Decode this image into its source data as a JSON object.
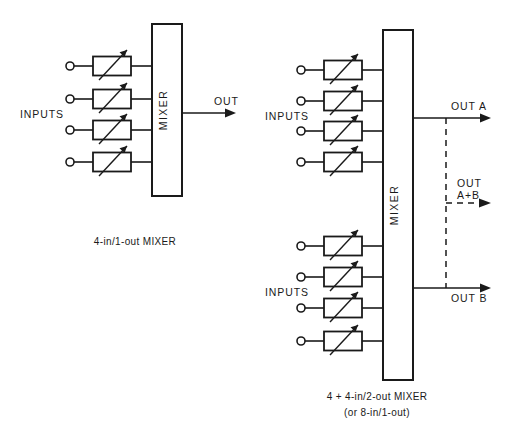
{
  "figure": {
    "background_color": "#ffffff",
    "line_color": "#1a1a1a"
  },
  "diagrams": [
    {
      "id": "left",
      "caption": "4-in/1-out MIXER",
      "inputs_label": "INPUTS",
      "block_label": "MIXER",
      "input_count": 4,
      "outputs": [
        {
          "label": "OUT",
          "style": "solid"
        }
      ]
    },
    {
      "id": "right",
      "caption_line1": "4 + 4-in/2-out MIXER",
      "caption_line2": "(or 8-in/1-out)",
      "block_label": "MIXER",
      "groups": [
        {
          "inputs_label": "INPUTS",
          "input_count": 4
        },
        {
          "inputs_label": "INPUTS",
          "input_count": 4
        }
      ],
      "outputs": [
        {
          "label": "OUT A",
          "style": "solid"
        },
        {
          "label_line1": "OUT",
          "label_line2": "A+B",
          "style": "dashed"
        },
        {
          "label": "OUT B",
          "style": "solid"
        }
      ]
    }
  ]
}
